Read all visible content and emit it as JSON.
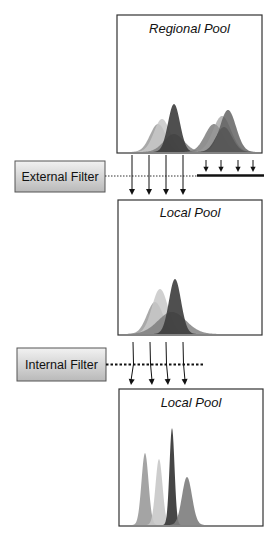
{
  "pools": [
    {
      "id": "regional",
      "label": "Regional Pool",
      "box": {
        "x": 117,
        "y": 15,
        "w": 145,
        "h": 138
      },
      "peaks": [
        {
          "center": 158,
          "height": 28,
          "sigma": 8,
          "color": "#9a9a9a",
          "opacity": 0.85
        },
        {
          "center": 162,
          "height": 33,
          "sigma": 8,
          "color": "#c8c8c8",
          "opacity": 0.85
        },
        {
          "center": 174,
          "height": 18,
          "sigma": 10,
          "color": "#7a7a7a",
          "opacity": 0.8
        },
        {
          "center": 174,
          "height": 48,
          "sigma": 6,
          "color": "#3c3c3c",
          "opacity": 0.9
        },
        {
          "center": 214,
          "height": 28,
          "sigma": 9,
          "color": "#7d7d7d",
          "opacity": 0.85
        },
        {
          "center": 222,
          "height": 36,
          "sigma": 9,
          "color": "#9a9a9a",
          "opacity": 0.7
        },
        {
          "center": 224,
          "height": 25,
          "sigma": 8,
          "color": "#454545",
          "opacity": 0.85
        },
        {
          "center": 228,
          "height": 42,
          "sigma": 8,
          "color": "#5a5a5a",
          "opacity": 0.8
        }
      ]
    },
    {
      "id": "local-1",
      "label": "Local Pool",
      "box": {
        "x": 118,
        "y": 200,
        "w": 144,
        "h": 135
      },
      "peaks": [
        {
          "center": 155,
          "height": 32,
          "sigma": 8,
          "color": "#9a9a9a",
          "opacity": 0.85
        },
        {
          "center": 160,
          "height": 45,
          "sigma": 8,
          "color": "#c8c8c8",
          "opacity": 0.85
        },
        {
          "center": 172,
          "height": 22,
          "sigma": 14,
          "color": "#7a7a7a",
          "opacity": 0.8
        },
        {
          "center": 175,
          "height": 55,
          "sigma": 6,
          "color": "#3c3c3c",
          "opacity": 0.9
        }
      ]
    },
    {
      "id": "local-2",
      "label": "Local Pool",
      "box": {
        "x": 119,
        "y": 389,
        "w": 144,
        "h": 137
      },
      "peaks": [
        {
          "center": 145,
          "height": 72,
          "sigma": 3.5,
          "color": "#9a9a9a",
          "opacity": 0.9
        },
        {
          "center": 159,
          "height": 66,
          "sigma": 3.5,
          "color": "#c8c8c8",
          "opacity": 0.9
        },
        {
          "center": 172,
          "height": 97,
          "sigma": 2.5,
          "color": "#3c3c3c",
          "opacity": 0.95
        },
        {
          "center": 187,
          "height": 48,
          "sigma": 5,
          "color": "#7d7d7d",
          "opacity": 0.9
        }
      ]
    }
  ],
  "filters": [
    {
      "id": "external",
      "label": "External Filter",
      "box": {
        "x": 15,
        "y": 161,
        "w": 90,
        "h": 31
      },
      "line_y": 176,
      "dotted_to": 197,
      "barrier": {
        "x1": 197,
        "x2": 264,
        "y": 175
      },
      "pass_arrows": {
        "xs": [
          132,
          149,
          166,
          183
        ],
        "y1": 155,
        "y2": 195
      },
      "blocked_arrows": {
        "xs": [
          206,
          221,
          238,
          253
        ],
        "y1": 160,
        "y2": 172
      }
    },
    {
      "id": "internal",
      "label": "Internal Filter",
      "box": {
        "x": 17,
        "y": 348,
        "w": 89,
        "h": 33
      },
      "line_y": 364,
      "dotted_to": 205,
      "pass_arrows": {
        "xs": [
          133,
          150,
          166,
          183
        ],
        "y1": 342,
        "y2": 385,
        "bend": 2
      }
    }
  ],
  "colors": {
    "border": "#333333",
    "filter_fill_top": "#f2f2f2",
    "filter_fill_bottom": "#b9b9b9"
  }
}
